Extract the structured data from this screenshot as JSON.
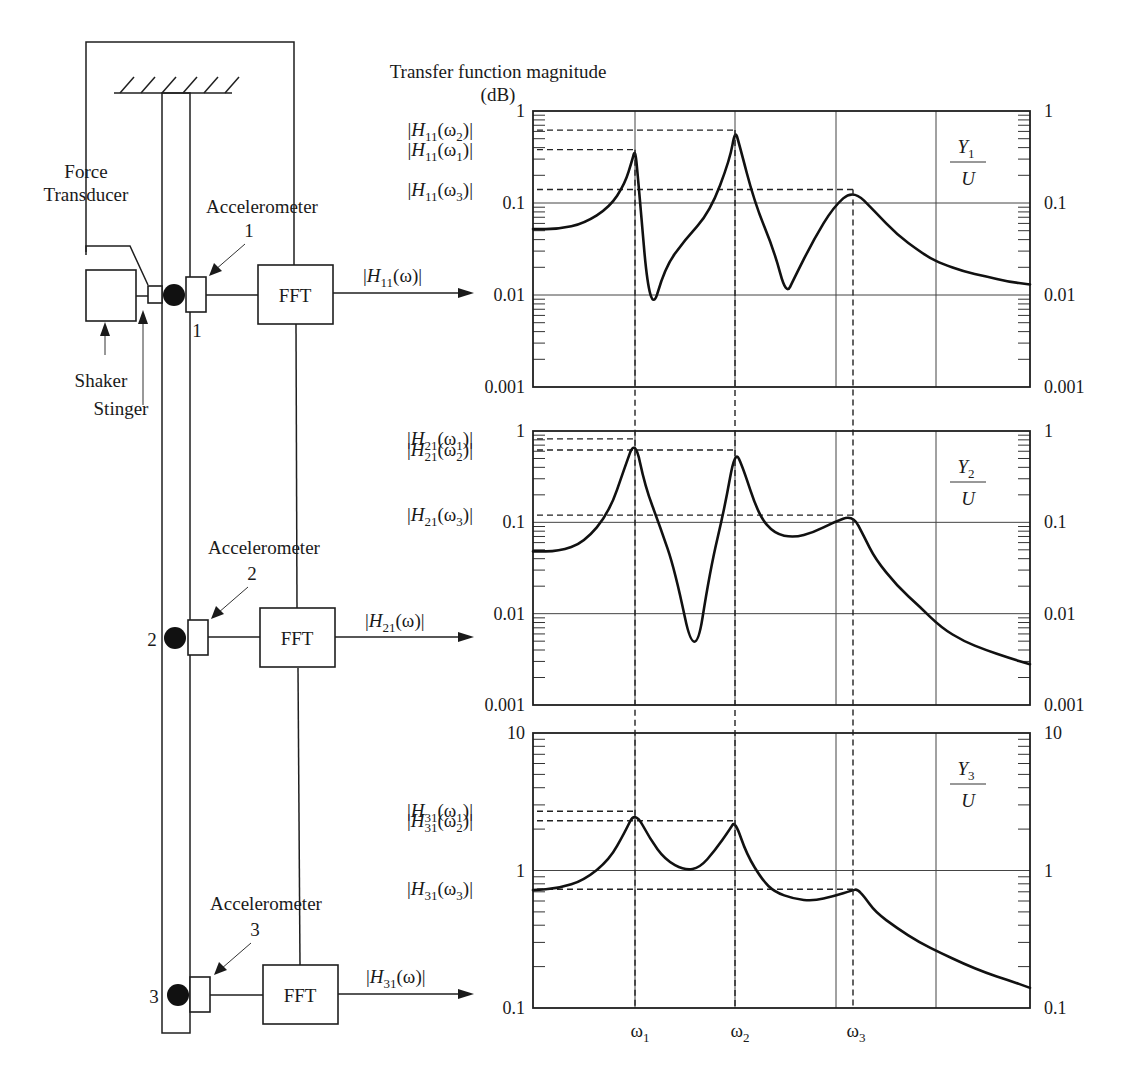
{
  "title": {
    "line1": "Transfer function magnitude",
    "line2": "(dB)"
  },
  "diagram": {
    "force_transducer": {
      "line1": "Force",
      "line2": "Transducer"
    },
    "shaker": "Shaker",
    "stinger": "Stinger",
    "accelerometers": [
      {
        "label": "Accelerometer",
        "number": "1",
        "point": "1",
        "fft": "FFT",
        "output": {
          "H": "H",
          "sub": "11",
          "arg": "(ω)"
        }
      },
      {
        "label": "Accelerometer",
        "number": "2",
        "point": "2",
        "fft": "FFT",
        "output": {
          "H": "H",
          "sub": "21",
          "arg": "(ω)"
        }
      },
      {
        "label": "Accelerometer",
        "number": "3",
        "point": "3",
        "fft": "FFT",
        "output": {
          "H": "H",
          "sub": "31",
          "arg": "(ω)"
        }
      }
    ]
  },
  "x_ticks": [
    {
      "sym": "ω",
      "sub": "1"
    },
    {
      "sym": "ω",
      "sub": "2"
    },
    {
      "sym": "ω",
      "sub": "3"
    }
  ],
  "chart_data": [
    {
      "type": "line",
      "title": "Y1/U",
      "ratio": {
        "num": "Y",
        "num_sub": "1",
        "den": "U"
      },
      "yscale": "log",
      "ylim": [
        0.001,
        1
      ],
      "yticks": [
        "1",
        "0.1",
        "0.01",
        "0.001"
      ],
      "xticks": [
        "ω1",
        "ω2",
        "ω3"
      ],
      "peak_labels": [
        {
          "H": "H",
          "sub": "11",
          "w": "2",
          "value": 0.62
        },
        {
          "H": "H",
          "sub": "11",
          "w": "1",
          "value": 0.38
        },
        {
          "H": "H",
          "sub": "11",
          "w": "3",
          "value": 0.14
        }
      ],
      "x": [
        0,
        0.5,
        1.0,
        1.5,
        1.8,
        1.95,
        2.0,
        2.05,
        2.3,
        2.6,
        3.0,
        3.5,
        3.9,
        4.0,
        4.1,
        4.5,
        5.0,
        5.3,
        5.5,
        6.0,
        6.5,
        7.0,
        8.0,
        9.0,
        10.0,
        10.5,
        11.0,
        12.0,
        13.0,
        14.0,
        15.0
      ],
      "values": [
        0.052,
        0.052,
        0.06,
        0.09,
        0.16,
        0.3,
        0.38,
        0.22,
        0.0055,
        0.02,
        0.04,
        0.08,
        0.3,
        0.62,
        0.45,
        0.1,
        0.03,
        0.01,
        0.015,
        0.04,
        0.09,
        0.14,
        0.08,
        0.045,
        0.03,
        0.025,
        0.022,
        0.018,
        0.016,
        0.014,
        0.013
      ]
    },
    {
      "type": "line",
      "title": "Y2/U",
      "ratio": {
        "num": "Y",
        "num_sub": "2",
        "den": "U"
      },
      "yscale": "log",
      "ylim": [
        0.001,
        1
      ],
      "yticks": [
        "1",
        "0.1",
        "0.01",
        "0.001"
      ],
      "xticks": [
        "ω1",
        "ω2",
        "ω3"
      ],
      "peak_labels": [
        {
          "H": "H",
          "sub": "21",
          "w": "1",
          "value": 0.82
        },
        {
          "H": "H",
          "sub": "21",
          "w": "2",
          "value": 0.62
        },
        {
          "H": "H",
          "sub": "21",
          "w": "3",
          "value": 0.12
        }
      ],
      "x": [
        0,
        0.5,
        1.0,
        1.5,
        1.8,
        2.0,
        2.2,
        2.5,
        2.8,
        3.2,
        3.5,
        3.8,
        4.0,
        4.2,
        4.6,
        5.0,
        5.5,
        6.0,
        6.5,
        7.0,
        7.5,
        8.0,
        9.0,
        10.0,
        11.0,
        12.0,
        13.0,
        14.0,
        15.0
      ],
      "values": [
        0.048,
        0.048,
        0.06,
        0.13,
        0.4,
        0.82,
        0.25,
        0.09,
        0.03,
        0.0027,
        0.03,
        0.15,
        0.62,
        0.4,
        0.12,
        0.075,
        0.068,
        0.078,
        0.1,
        0.12,
        0.07,
        0.04,
        0.02,
        0.012,
        0.007,
        0.005,
        0.004,
        0.0033,
        0.0028
      ]
    },
    {
      "type": "line",
      "title": "Y3/U",
      "ratio": {
        "num": "Y",
        "num_sub": "3",
        "den": "U"
      },
      "yscale": "log",
      "ylim": [
        0.1,
        10
      ],
      "yticks": [
        "10",
        "1",
        "0.1"
      ],
      "xticks": [
        "ω1",
        "ω2",
        "ω3"
      ],
      "peak_labels": [
        {
          "H": "H",
          "sub": "31",
          "w": "1",
          "value": 2.7
        },
        {
          "H": "H",
          "sub": "31",
          "w": "2",
          "value": 2.3
        },
        {
          "H": "H",
          "sub": "31",
          "w": "3",
          "value": 0.73
        }
      ],
      "x": [
        0,
        0.5,
        1.0,
        1.5,
        1.8,
        2.0,
        2.3,
        2.6,
        3.0,
        3.3,
        3.6,
        3.9,
        4.0,
        4.3,
        4.7,
        5.0,
        5.5,
        6.0,
        6.5,
        7.0,
        7.2,
        7.5,
        8.0,
        9.0,
        10.0,
        11.0,
        12.0,
        13.0,
        14.0,
        15.0
      ],
      "values": [
        0.72,
        0.74,
        0.85,
        1.2,
        1.9,
        2.7,
        1.7,
        1.2,
        1.0,
        1.05,
        1.4,
        2.0,
        2.3,
        1.3,
        0.85,
        0.7,
        0.62,
        0.6,
        0.65,
        0.72,
        0.73,
        0.65,
        0.5,
        0.38,
        0.3,
        0.25,
        0.21,
        0.18,
        0.16,
        0.14
      ]
    }
  ]
}
